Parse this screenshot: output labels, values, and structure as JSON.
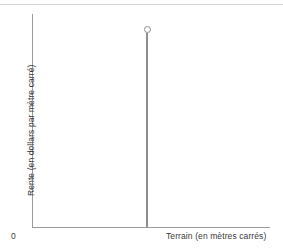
{
  "chart_data": {
    "type": "line",
    "title": "",
    "subtitle": "",
    "xlabel": "Terrain (en mètres carrés)",
    "ylabel": "Rente (en dollars par mètre carré)",
    "origin_label": "0",
    "grid": false,
    "legend": null,
    "xlim": [
      0,
      1
    ],
    "ylim": [
      0,
      1
    ],
    "xticks": [],
    "yticks": [],
    "series": [
      {
        "name": "Offre de terrain (parfaitement inélastique)",
        "type": "line",
        "x": [
          0.4825,
          0.4825
        ],
        "y": [
          0.0,
          1.0
        ],
        "color": "#8e8e8e",
        "marker_at_top": {
          "shape": "open-circle",
          "x": 0.4825,
          "y": 1.0,
          "color": "#8a8a8a"
        }
      }
    ],
    "annotations": [],
    "colors": {
      "axis": "#9b9b9b",
      "curve": "#8e8e8e",
      "marker": "#8a8a8a",
      "text": "#3a3a3a",
      "rule": "#d2d4d6",
      "background": "#ffffff"
    }
  }
}
